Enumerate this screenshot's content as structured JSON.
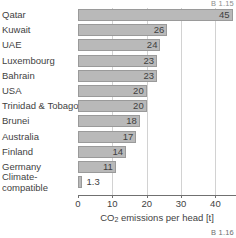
{
  "captions": {
    "top_right": "B 1.15",
    "bottom_right": "B 1.16"
  },
  "axis": {
    "title_prefix": "CO",
    "title_sub": "2",
    "title_suffix": " emissions per head [t]",
    "title_full": "CO2 emissions per head [t]",
    "ticks": [
      "0",
      "10",
      "20",
      "30",
      "40"
    ]
  },
  "colors": {
    "bar_fill": "#b9b9b9",
    "bar_stroke": "#9a9a9a",
    "grid": "#d2d2d2",
    "axis": "#707070",
    "text": "#3f3f3f"
  },
  "chart_data": {
    "type": "bar",
    "orientation": "horizontal",
    "title": "",
    "xlabel": "CO2 emissions per head [t]",
    "ylabel": "",
    "xlim": [
      0,
      46
    ],
    "xticks": [
      0,
      10,
      20,
      30,
      40
    ],
    "grid": true,
    "legend": false,
    "categories": [
      "Qatar",
      "Kuwait",
      "UAE",
      "Luxembourg",
      "Bahrain",
      "USA",
      "Trinidad & Tobago",
      "Brunei",
      "Australia",
      "Finland",
      "Germany",
      "Climate-compatible"
    ],
    "values": [
      45,
      26,
      24,
      23,
      23,
      20,
      20,
      18,
      17,
      14,
      11,
      1.3
    ],
    "data_labels": [
      "45",
      "26",
      "24",
      "23",
      "23",
      "20",
      "20",
      "18",
      "17",
      "14",
      "11",
      "1.3"
    ]
  }
}
